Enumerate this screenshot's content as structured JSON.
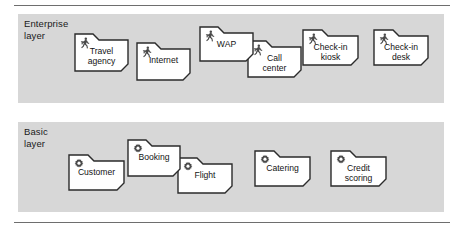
{
  "diagram": {
    "background_color": "#ffffff",
    "band_color": "#d7d7d7",
    "folder_fill": "#ffffff",
    "folder_stroke": "#2b2b2b",
    "rule_color": "#6e6e6e"
  },
  "layers": [
    {
      "id": "enterprise",
      "label": "Enterprise\nlayer",
      "icon": "running-person-icon",
      "nodes": [
        {
          "label": "Travel\nagency",
          "x": 74,
          "y": 33,
          "w": 55,
          "h": 39,
          "z": 6
        },
        {
          "label": "Internet",
          "x": 136,
          "y": 42,
          "w": 55,
          "h": 39,
          "z": 5
        },
        {
          "label": "WAP",
          "x": 199,
          "y": 26,
          "w": 55,
          "h": 36,
          "z": 4
        },
        {
          "label": "Call\ncenter",
          "x": 247,
          "y": 40,
          "w": 55,
          "h": 38,
          "z": 3
        },
        {
          "label": "Check-in\nkiosk",
          "x": 302,
          "y": 29,
          "w": 57,
          "h": 37,
          "z": 2
        },
        {
          "label": "Check-in\ndesk",
          "x": 373,
          "y": 29,
          "w": 56,
          "h": 37,
          "z": 1
        }
      ]
    },
    {
      "id": "basic",
      "label": "Basic\nlayer",
      "icon": "gear-icon",
      "nodes": [
        {
          "label": "Customer",
          "x": 68,
          "y": 154,
          "w": 57,
          "h": 37,
          "z": 2
        },
        {
          "label": "Booking",
          "x": 127,
          "y": 139,
          "w": 54,
          "h": 38,
          "z": 4
        },
        {
          "label": "Flight",
          "x": 177,
          "y": 157,
          "w": 56,
          "h": 37,
          "z": 3
        },
        {
          "label": "Catering",
          "x": 254,
          "y": 150,
          "w": 57,
          "h": 37,
          "z": 1
        },
        {
          "label": "Credit\nscoring",
          "x": 330,
          "y": 150,
          "w": 57,
          "h": 37,
          "z": 1
        }
      ]
    }
  ]
}
